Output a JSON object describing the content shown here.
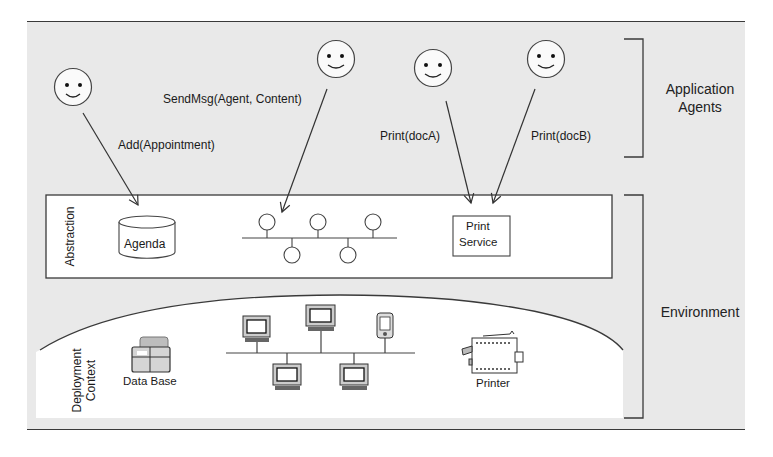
{
  "diagram": {
    "layers": {
      "application_agents": {
        "label_line1": "Application",
        "label_line2": "Agents"
      },
      "environment": {
        "label": "Environment"
      },
      "abstraction": {
        "label": "Abstraction"
      },
      "deployment_context": {
        "label_line1": "Deployment",
        "label_line2": "Context"
      }
    },
    "agents": [
      {
        "id": "agent-1",
        "icon": "smiley-face-icon",
        "call": "Add(Appointment)",
        "target": "Agenda"
      },
      {
        "id": "agent-2",
        "icon": "smiley-face-icon",
        "call": "SendMsg(Agent, Content)",
        "target": "Message Bus"
      },
      {
        "id": "agent-3",
        "icon": "smiley-face-icon",
        "call": "Print(docA)",
        "target": "Print Service"
      },
      {
        "id": "agent-4",
        "icon": "smiley-face-icon",
        "call": "Print(docB)",
        "target": "Print Service"
      }
    ],
    "abstraction_components": {
      "agenda": {
        "icon": "cylinder-icon",
        "label": "Agenda"
      },
      "message_bus": {
        "icon": "bus-network-icon",
        "nodes_top": 3,
        "nodes_bottom": 2
      },
      "print_service": {
        "label_line1": "Print",
        "label_line2": "Service"
      }
    },
    "deployment_components": {
      "database": {
        "icon": "database-icon",
        "label": "Data Base"
      },
      "network": {
        "icon": "computer-network-icon",
        "computers_top": 2,
        "pda_top": 1,
        "computers_bottom": 2
      },
      "printer": {
        "icon": "printer-icon",
        "label": "Printer"
      }
    }
  }
}
